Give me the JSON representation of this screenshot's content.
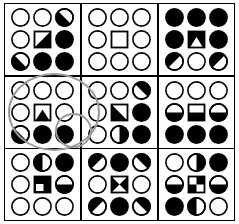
{
  "figure": {
    "colors": {
      "fill": "#000000",
      "stroke": "#000000",
      "background": "#ffffff",
      "annotation": "#9a9a9a"
    },
    "grid": {
      "rows": 3,
      "cols": 3
    }
  },
  "annotations": [
    {
      "name": "highlight-ellipse-large",
      "shape": "ellipse",
      "target": "cell-2-1"
    },
    {
      "name": "highlight-ellipse-small",
      "shape": "ellipse",
      "target": "cell-2-1-slot-9"
    }
  ],
  "cells": [
    {
      "id": "cell-1-1",
      "row": 1,
      "col": 1,
      "shapes": [
        {
          "shape": "circle",
          "fill": "empty"
        },
        {
          "shape": "circle",
          "fill": "empty"
        },
        {
          "shape": "circle",
          "fill": "diag-lower-left"
        },
        {
          "shape": "circle",
          "fill": "empty"
        },
        {
          "shape": "square",
          "fill": "diag-lower-right"
        },
        {
          "shape": "circle",
          "fill": "full"
        },
        {
          "shape": "circle",
          "fill": "diag-lower-left"
        },
        {
          "shape": "circle",
          "fill": "full"
        },
        {
          "shape": "circle",
          "fill": "full"
        }
      ]
    },
    {
      "id": "cell-1-2",
      "row": 1,
      "col": 2,
      "shapes": [
        {
          "shape": "circle",
          "fill": "empty"
        },
        {
          "shape": "circle",
          "fill": "empty"
        },
        {
          "shape": "circle",
          "fill": "empty"
        },
        {
          "shape": "circle",
          "fill": "empty"
        },
        {
          "shape": "square",
          "fill": "empty"
        },
        {
          "shape": "circle",
          "fill": "empty"
        },
        {
          "shape": "circle",
          "fill": "empty"
        },
        {
          "shape": "circle",
          "fill": "empty"
        },
        {
          "shape": "circle",
          "fill": "empty"
        }
      ]
    },
    {
      "id": "cell-1-3",
      "row": 1,
      "col": 3,
      "shapes": [
        {
          "shape": "circle",
          "fill": "full"
        },
        {
          "shape": "circle",
          "fill": "full"
        },
        {
          "shape": "circle",
          "fill": "full"
        },
        {
          "shape": "circle",
          "fill": "full"
        },
        {
          "shape": "square",
          "fill": "triangle-up-white-on-black"
        },
        {
          "shape": "circle",
          "fill": "full"
        },
        {
          "shape": "circle",
          "fill": "diag-upper-left"
        },
        {
          "shape": "circle",
          "fill": "empty"
        },
        {
          "shape": "circle",
          "fill": "diag-upper-left"
        }
      ]
    },
    {
      "id": "cell-2-1",
      "row": 2,
      "col": 1,
      "shapes": [
        {
          "shape": "circle",
          "fill": "empty"
        },
        {
          "shape": "circle",
          "fill": "empty"
        },
        {
          "shape": "circle",
          "fill": "empty"
        },
        {
          "shape": "circle",
          "fill": "empty"
        },
        {
          "shape": "square",
          "fill": "triangle-up-black-on-white"
        },
        {
          "shape": "circle",
          "fill": "empty"
        },
        {
          "shape": "circle",
          "fill": "diag-lower-left"
        },
        {
          "shape": "circle",
          "fill": "full"
        },
        {
          "shape": "circle",
          "fill": "full"
        }
      ]
    },
    {
      "id": "cell-2-2",
      "row": 2,
      "col": 2,
      "shapes": [
        {
          "shape": "circle",
          "fill": "empty"
        },
        {
          "shape": "circle",
          "fill": "empty"
        },
        {
          "shape": "circle",
          "fill": "diag-upper-right"
        },
        {
          "shape": "circle",
          "fill": "empty"
        },
        {
          "shape": "square",
          "fill": "triangle-lower-left-black"
        },
        {
          "shape": "circle",
          "fill": "full"
        },
        {
          "shape": "circle",
          "fill": "empty"
        },
        {
          "shape": "circle",
          "fill": "half-right"
        },
        {
          "shape": "circle",
          "fill": "full"
        }
      ]
    },
    {
      "id": "cell-2-3",
      "row": 2,
      "col": 3,
      "shapes": [
        {
          "shape": "circle",
          "fill": "empty"
        },
        {
          "shape": "circle",
          "fill": "empty"
        },
        {
          "shape": "circle",
          "fill": "empty"
        },
        {
          "shape": "circle",
          "fill": "half-bottom"
        },
        {
          "shape": "square",
          "fill": "half-bottom"
        },
        {
          "shape": "circle",
          "fill": "half-bottom"
        },
        {
          "shape": "circle",
          "fill": "full"
        },
        {
          "shape": "circle",
          "fill": "full"
        },
        {
          "shape": "circle",
          "fill": "full"
        }
      ]
    },
    {
      "id": "cell-3-1",
      "row": 3,
      "col": 1,
      "shapes": [
        {
          "shape": "circle",
          "fill": "empty"
        },
        {
          "shape": "circle",
          "fill": "half-left"
        },
        {
          "shape": "circle",
          "fill": "full"
        },
        {
          "shape": "circle",
          "fill": "empty"
        },
        {
          "shape": "square",
          "fill": "black-with-white-corner-lower-left"
        },
        {
          "shape": "circle",
          "fill": "half-bottom"
        },
        {
          "shape": "circle",
          "fill": "empty"
        },
        {
          "shape": "circle",
          "fill": "empty"
        },
        {
          "shape": "circle",
          "fill": "empty"
        }
      ]
    },
    {
      "id": "cell-3-2",
      "row": 3,
      "col": 2,
      "shapes": [
        {
          "shape": "circle",
          "fill": "diag-upper-left"
        },
        {
          "shape": "circle",
          "fill": "full"
        },
        {
          "shape": "circle",
          "fill": "diag-upper-right"
        },
        {
          "shape": "circle",
          "fill": "empty"
        },
        {
          "shape": "square",
          "fill": "bowtie-horizontal"
        },
        {
          "shape": "circle",
          "fill": "empty"
        },
        {
          "shape": "circle",
          "fill": "diag-upper-left"
        },
        {
          "shape": "circle",
          "fill": "full"
        },
        {
          "shape": "circle",
          "fill": "diag-upper-right"
        }
      ]
    },
    {
      "id": "cell-3-3",
      "row": 3,
      "col": 3,
      "shapes": [
        {
          "shape": "circle",
          "fill": "empty"
        },
        {
          "shape": "circle",
          "fill": "half-right"
        },
        {
          "shape": "circle",
          "fill": "full"
        },
        {
          "shape": "circle",
          "fill": "half-bottom"
        },
        {
          "shape": "square",
          "fill": "checkerboard"
        },
        {
          "shape": "circle",
          "fill": "half-bottom"
        },
        {
          "shape": "circle",
          "fill": "full"
        },
        {
          "shape": "circle",
          "fill": "half-left"
        },
        {
          "shape": "circle",
          "fill": "empty"
        }
      ]
    }
  ]
}
